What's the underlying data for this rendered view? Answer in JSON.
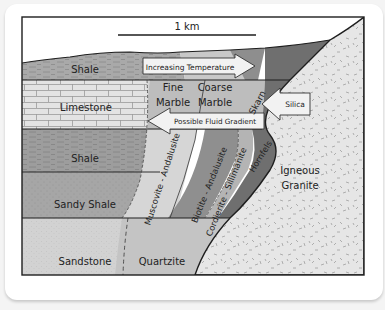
{
  "diagram": {
    "scale_bar": {
      "label": "1 km"
    },
    "sedimentary_layers": [
      {
        "id": "shale-top",
        "label": "Shale",
        "color": "#a9a9a9"
      },
      {
        "id": "limestone",
        "label": "Limestone",
        "color": "#e3e3e3"
      },
      {
        "id": "shale-mid",
        "label": "Shale",
        "color": "#9d9d9d"
      },
      {
        "id": "sandy-shale",
        "label": "Sandy Shale",
        "color": "#a6a6a6"
      },
      {
        "id": "sandstone",
        "label": "Sandstone",
        "color": "#d2d2d2"
      }
    ],
    "metamorphic_zones": {
      "fine_marble": {
        "line1": "Fine",
        "line2": "Marble"
      },
      "coarse_marble": {
        "line1": "Coarse",
        "line2": "Marble"
      },
      "skarn": "Skarn",
      "muscovite_andalusite": "Muscovite - Andalusite",
      "biotite_andalusite": "Biotite - Andalusite",
      "cordierite_sillimanite": "Cordierite - Sillimanite",
      "hornfels": "Hornfels",
      "quartzite": "Quartzite"
    },
    "intrusion": {
      "line1": "Igneous",
      "line2": "Granite",
      "color": "#e6e6e6"
    },
    "arrows": {
      "increasing_temperature": "Increasing Temperature",
      "silica": "Silica",
      "possible_fluid_gradient": "Possible Fluid Gradient"
    },
    "colors": {
      "outline": "#1e1e1e",
      "zone_light": "#cfcfcf",
      "zone_mid": "#8e8e8e",
      "zone_dark": "#6f6f6f",
      "arrow_fill": "#f2f2f2"
    }
  }
}
